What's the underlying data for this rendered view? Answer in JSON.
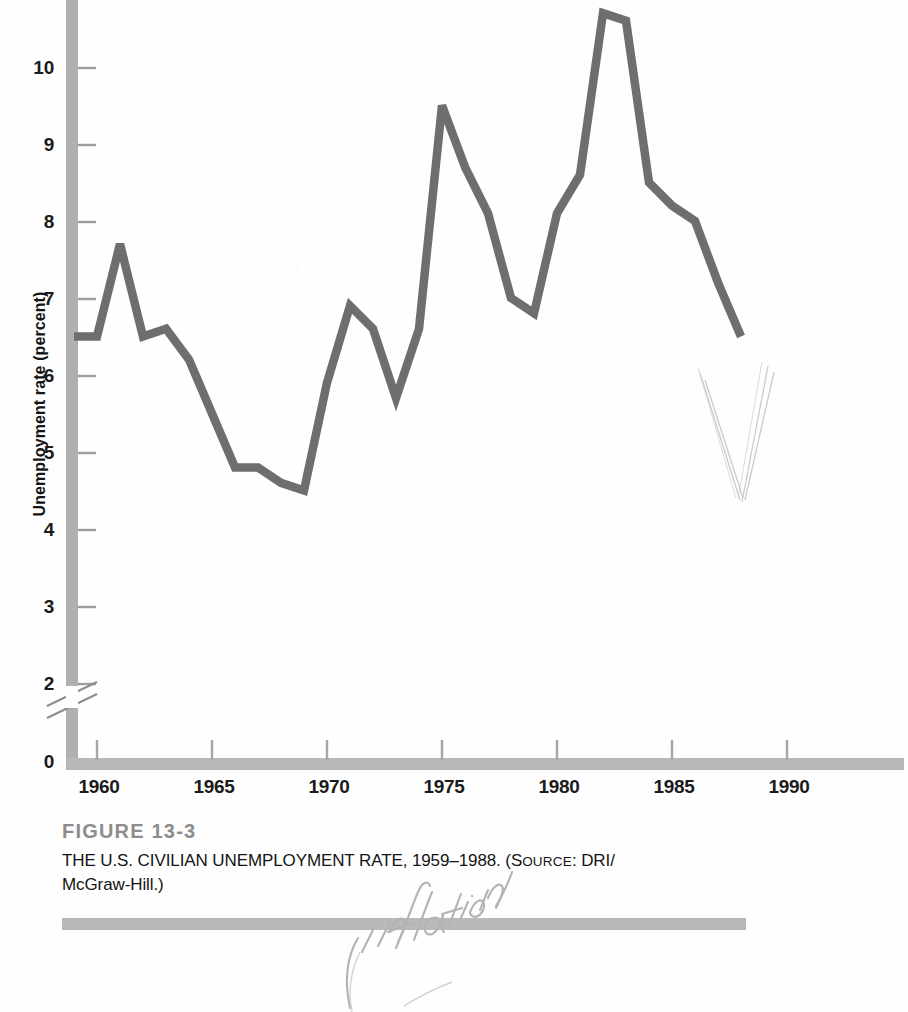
{
  "figure": {
    "number": "FIGURE 13-3",
    "caption_main": "THE U.S. CIVILIAN UNEMPLOYMENT RATE, 1959",
    "caption_dash": "–",
    "caption_after_years": "1988. (",
    "source_label": "S",
    "source_label_rest": "OURCE",
    "source_value": ": DRI/",
    "caption_line2": "McGraw-Hill.)"
  },
  "annotations": {
    "handwritten_note": "inflation"
  },
  "colors": {
    "line": "#6e6e6e",
    "axis": "#a8a8a8",
    "tick": "#9a9a9a",
    "figure_number": "#8d8d8d",
    "rule": "#b9b9b9",
    "text": "#141414",
    "pencil": "#bdbdbd"
  },
  "chart_data": {
    "type": "line",
    "xlabel": "",
    "ylabel": "Unemployment rate (percent)",
    "xlim": [
      1959,
      1993
    ],
    "ylim": [
      0,
      10.6
    ],
    "y_axis_break": true,
    "y_axis_break_between": [
      0,
      2
    ],
    "grid": false,
    "legend": false,
    "yticks": [
      0,
      2,
      3,
      4,
      5,
      6,
      7,
      8,
      9,
      10
    ],
    "ytick_labels": [
      "0",
      "2",
      "3",
      "4",
      "5",
      "6",
      "7",
      "8",
      "9",
      "10"
    ],
    "xticks": [
      1960,
      1965,
      1970,
      1975,
      1980,
      1985,
      1990
    ],
    "xtick_labels": [
      "1960",
      "1965",
      "1970",
      "1975",
      "1980",
      "1985",
      "1990"
    ],
    "series": [
      {
        "name": "U.S. civilian unemployment rate",
        "x": [
          1959,
          1960,
          1961,
          1962,
          1963,
          1964,
          1965,
          1966,
          1967,
          1968,
          1969,
          1970,
          1971,
          1972,
          1973,
          1974,
          1975,
          1976,
          1977,
          1978,
          1979,
          1980,
          1981,
          1982,
          1983,
          1984,
          1985,
          1986,
          1987,
          1988
        ],
        "values": [
          5.5,
          5.5,
          6.7,
          5.5,
          5.6,
          5.2,
          4.5,
          3.8,
          3.8,
          3.6,
          3.5,
          4.9,
          5.9,
          5.6,
          4.7,
          5.6,
          8.5,
          7.7,
          7.1,
          6.0,
          5.8,
          7.1,
          7.6,
          9.7,
          9.6,
          7.5,
          7.2,
          7.0,
          6.2,
          5.5
        ]
      }
    ]
  }
}
